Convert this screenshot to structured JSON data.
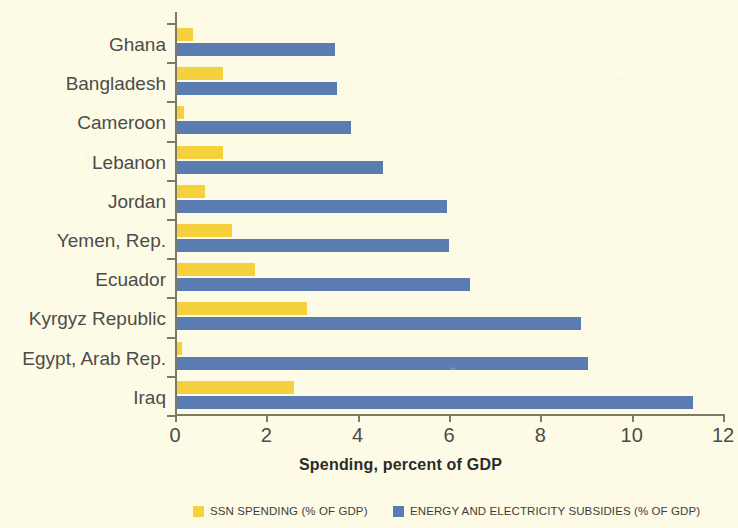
{
  "chart_data": {
    "type": "bar",
    "orientation": "horizontal",
    "title": "",
    "xlabel": "Spending, percent of GDP",
    "ylabel": "",
    "xlim": [
      0,
      12
    ],
    "xticks": [
      "0",
      "2",
      "4",
      "6",
      "8",
      "10",
      "12"
    ],
    "grid": false,
    "legend_position": "bottom",
    "categories": [
      "Ghana",
      "Bangladesh",
      "Cameroon",
      "Lebanon",
      "Jordan",
      "Yemen, Rep.",
      "Ecuador",
      "Kyrgyz Republic",
      "Egypt, Arab Rep.",
      "Iraq"
    ],
    "series": [
      {
        "name": "SSN SPENDING (% OF GDP)",
        "color": "#f5d23d",
        "values": [
          0.4,
          1.05,
          0.2,
          1.05,
          0.65,
          1.25,
          1.75,
          2.9,
          0.15,
          2.6
        ]
      },
      {
        "name": "ENERGY AND ELECTRICITY SUBSIDIES (% OF GDP)",
        "color": "#5a7cb0",
        "values": [
          3.5,
          3.55,
          3.85,
          4.55,
          5.95,
          6.0,
          6.45,
          8.9,
          9.05,
          11.35
        ]
      }
    ]
  },
  "legend": {
    "entries": [
      {
        "label": "SSN SPENDING (% OF GDP)",
        "color": "#f5d23d"
      },
      {
        "label": "ENERGY AND ELECTRICITY SUBSIDIES (% OF GDP)",
        "color": "#5a7cb0"
      }
    ]
  },
  "axis_title": "Spending, percent of GDP"
}
